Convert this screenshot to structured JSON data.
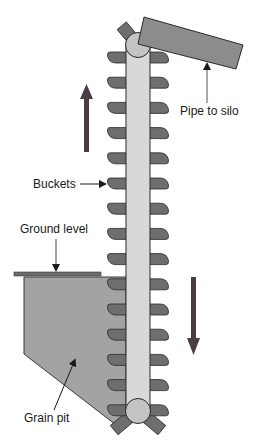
{
  "diagram": {
    "type": "bucket-elevator",
    "labels": {
      "pipe": "Pipe to silo",
      "buckets": "Buckets",
      "ground": "Ground level",
      "pit": "Grain pit"
    },
    "motion": {
      "up_side": "left",
      "down_side": "right"
    },
    "bucket_count_per_side": 15,
    "colors": {
      "belt": "#d8d8d8",
      "bucket": "#6e6e6e",
      "pipe": "#8c8c8c",
      "pit": "#a0a0a0",
      "ground": "#6a6a6a",
      "pulley": "#c4c4c4",
      "arrow": "#4a3c44",
      "outline": "#2a2a2a"
    }
  }
}
